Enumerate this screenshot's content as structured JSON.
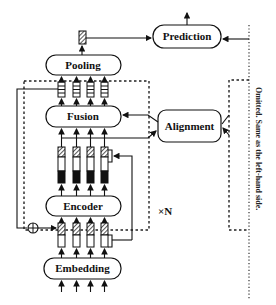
{
  "diagram": {
    "nodes": {
      "prediction": {
        "label": "Prediction"
      },
      "pooling": {
        "label": "Pooling"
      },
      "fusion": {
        "label": "Fusion"
      },
      "alignment": {
        "label": "Alignment"
      },
      "encoder": {
        "label": "Encoder"
      },
      "embedding": {
        "label": "Embedding"
      }
    },
    "repeat_label": "×N",
    "omitted_note": "Omitted. Same as the left-hand side.",
    "edges": [
      {
        "from": "embedding",
        "to": "token-vectors"
      },
      {
        "from": "token-vectors",
        "to": "encoder"
      },
      {
        "from": "encoder",
        "to": "encoded-vectors"
      },
      {
        "from": "encoded-vectors",
        "to": "alignment"
      },
      {
        "from": "alignment",
        "to": "fusion"
      },
      {
        "from": "encoded-vectors",
        "to": "fusion"
      },
      {
        "from": "fusion",
        "to": "fused-vectors"
      },
      {
        "from": "fused-vectors",
        "to": "pooling"
      },
      {
        "from": "pooling",
        "to": "pooled-vector"
      },
      {
        "from": "pooled-vector",
        "to": "prediction"
      },
      {
        "from": "right-branch",
        "to": "prediction"
      },
      {
        "from": "right-branch",
        "to": "alignment"
      },
      {
        "from": "fused-vectors",
        "to": "residual-add"
      },
      {
        "from": "residual-add",
        "to": "token-vectors"
      }
    ]
  }
}
